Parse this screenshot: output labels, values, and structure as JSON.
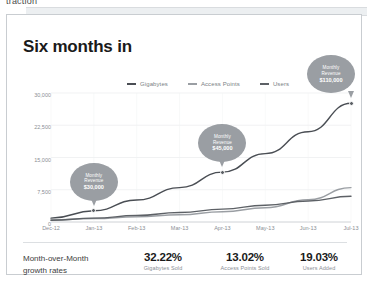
{
  "page": {
    "cut_off_text": "traction"
  },
  "scrollbar": {
    "name": "horizontal-scrollbar"
  },
  "card": {
    "title": "Six months in"
  },
  "chart_data": {
    "type": "line",
    "title": "Six months in",
    "xlabel": "",
    "ylabel": "",
    "grid": true,
    "legend_position": "top-center",
    "ylim": [
      0,
      30000
    ],
    "yticks": [
      "30,000",
      "22,500",
      "15,000",
      "7,500",
      "0"
    ],
    "ytick_values": [
      30000,
      22500,
      15000,
      7500,
      0
    ],
    "categories": [
      "Dec-12",
      "Jan-13",
      "Feb-13",
      "Mar-13",
      "Apr-13",
      "May-13",
      "Jun-13",
      "Jul-13"
    ],
    "series": [
      {
        "name": "Gigabytes",
        "color": "#4a4e54",
        "values": [
          900,
          2600,
          5100,
          8000,
          11600,
          15900,
          21000,
          27600
        ]
      },
      {
        "name": "Access Points",
        "color": "#9a9ea3",
        "values": [
          450,
          800,
          1200,
          1700,
          2400,
          3300,
          5200,
          8000
        ]
      },
      {
        "name": "Users",
        "color": "#5d6166",
        "values": [
          400,
          900,
          1500,
          2200,
          3000,
          3900,
          4900,
          6000
        ]
      }
    ],
    "annotations": [
      {
        "line1": "Monthly",
        "line2": "Revenue",
        "value": "$30,000",
        "at_category": "Jan-13",
        "at_value": 2600
      },
      {
        "line1": "Monthly",
        "line2": "Revenue",
        "value": "$45,000",
        "at_category": "Apr-13",
        "at_value": 11600
      },
      {
        "line1": "Monthly",
        "line2": "Revenue",
        "value": "$110,000",
        "at_category": "Jul-13",
        "at_value": 27600
      }
    ]
  },
  "footer": {
    "label_line1": "Month-over-Month",
    "label_line2": "growth rates",
    "stats": [
      {
        "value": "32.22%",
        "label": "Gigabytes Sold"
      },
      {
        "value": "13.02%",
        "label": "Access Points Sold"
      },
      {
        "value": "19.03%",
        "label": "Users Added"
      }
    ]
  },
  "colors": {
    "card_border": "#c9cdd1",
    "bubble": "#9a9ea3",
    "axis_text": "#8a8e94",
    "title_text": "#1a1a1a"
  }
}
